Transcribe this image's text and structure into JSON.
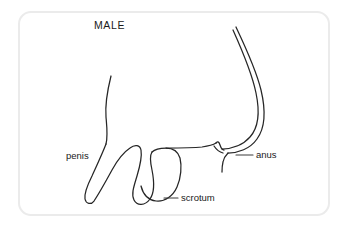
{
  "figure": {
    "title": "MALE",
    "title_pos": {
      "x": 94,
      "y": 29
    },
    "frame": {
      "border_color": "#ebebeb",
      "background_color": "#ffffff",
      "radius": 13
    },
    "line_color": "#262626",
    "labels": [
      {
        "id": "penis",
        "text": "penis",
        "x": 66,
        "y": 159,
        "anchor": "start",
        "leader": null
      },
      {
        "id": "anus",
        "text": "anus",
        "x": 256,
        "y": 158,
        "anchor": "start",
        "leader": "M 236 155 L 253 155"
      },
      {
        "id": "scrotum",
        "text": "scrotum",
        "x": 181,
        "y": 201,
        "anchor": "start",
        "leader": "M 164 198 L 178 198"
      }
    ],
    "outlines": [
      {
        "id": "abdomen-front-line",
        "d": "M 111 76 C 107 92 105 104 106 117 C 107 128 108 136 106 144"
      },
      {
        "id": "penis-outline",
        "d": "M 106 144 C 103 152 97 165 92 176 C 87 186 84 193 85 199 C 86 204 91 205 94 201 C 98 195 106 181 112 170 C 118 159 124 152 130 148 C 135 144 140 145 141 150 C 142 156 140 166 137 176 C 134 186 131 194 134 200 C 137 206 145 206 150 199 C 155 192 154 180 152 170 C 150 161 150 155 152 152"
      },
      {
        "id": "scrotum-outline",
        "d": "M 152 152 C 155 149 159 148 166 148 C 173 148 178 151 180 158 C 182 166 181 178 177 187 C 173 196 165 202 156 201 C 148 200 143 194 141 186"
      },
      {
        "id": "perineum-line",
        "d": "M 166 148 C 178 148 192 148 202 147 C 209 146 213 145 216 143"
      },
      {
        "id": "buttock-outer-curve",
        "d": "M 236 27 C 245 46 256 69 261 90 C 266 111 265 128 257 139 C 250 149 238 153 228 153"
      },
      {
        "id": "buttock-inner-curve",
        "d": "M 233 30 C 242 50 252 73 256 93 C 260 112 258 128 250 137 C 243 145 232 149 222 149"
      },
      {
        "id": "gluteal-cleft-detail",
        "d": "M 216 143 C 218 141 219 142 220 145 C 221 148 222 150 224 150"
      },
      {
        "id": "anus-tick-mark",
        "d": "M 228 153 C 226 155 224 157 223 162 C 222 166 222 169 222 172"
      },
      {
        "id": "perineal-raphe-mark",
        "d": "M 214 146 C 216 149 219 152 223 153"
      }
    ]
  }
}
